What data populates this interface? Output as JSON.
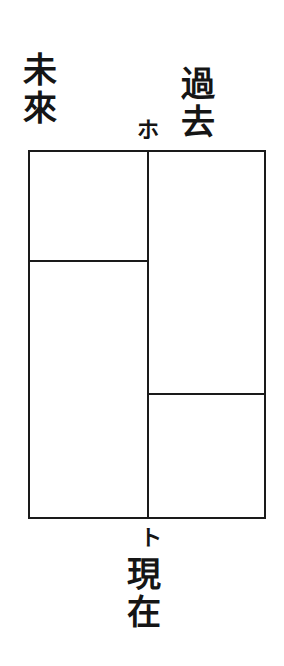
{
  "diagram": {
    "labels": {
      "future": "未來",
      "past": "過去",
      "present": "現在",
      "point_ho": "ホ",
      "point_to": "ト"
    },
    "frame": {
      "left": 28,
      "top": 150,
      "right": 265,
      "bottom": 518,
      "center_x": 148
    },
    "dividers": {
      "left_column_y": 261,
      "right_column_y": 394
    },
    "colors": {
      "ink": "#1a1a1a",
      "paper": "#ffffff"
    }
  }
}
